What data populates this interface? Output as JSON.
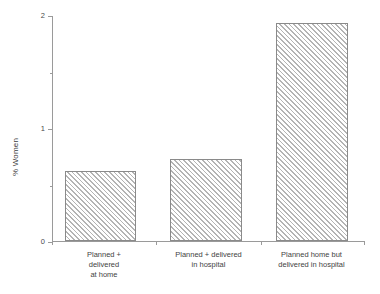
{
  "chart_data": {
    "type": "bar",
    "title": "",
    "xlabel": "",
    "ylabel": "% Women",
    "ylim": [
      0,
      2
    ],
    "grid": false,
    "legend": null,
    "y_major_ticks": [
      0,
      1,
      2
    ],
    "y_minor_ticks": [
      0.5,
      1.5
    ],
    "y_tick_labels": [
      "0",
      "1",
      "2"
    ],
    "categories": [
      "Planned +\ndelivered\nat home",
      "Planned + delivered\nin hospital",
      "Planned home but\ndelivered in hospital"
    ],
    "values": [
      0.62,
      0.73,
      1.93
    ],
    "bar_style": {
      "fill": "hatched-diagonal",
      "hatch_color": "#b4b4b4",
      "edge_color": "#8a8a8a",
      "face_color": "#ffffff"
    }
  },
  "axis": {
    "spine_color": "#9a9a9a",
    "tick_color": "#9a9a9a"
  },
  "labels": {
    "y_axis_title": "% Women",
    "tick_2": "2",
    "tick_1": "1",
    "tick_0": "0",
    "cat_0": "Planned +\ndelivered\nat home",
    "cat_1": "Planned + delivered\nin hospital",
    "cat_2": "Planned home but\ndelivered in hospital"
  }
}
